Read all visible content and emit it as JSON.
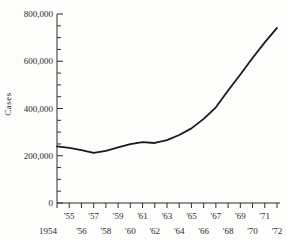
{
  "chart_data": {
    "type": "line",
    "title": "",
    "ylabel": "Cases",
    "xlabel": "",
    "x": [
      1954,
      1955,
      1956,
      1957,
      1958,
      1959,
      1960,
      1961,
      1962,
      1963,
      1964,
      1965,
      1966,
      1967,
      1968,
      1969,
      1970,
      1971,
      1972
    ],
    "values": [
      240000,
      233000,
      224000,
      212000,
      221000,
      235000,
      249000,
      258000,
      254000,
      266000,
      288000,
      316000,
      356000,
      405000,
      476000,
      544000,
      614000,
      680000,
      741000
    ],
    "xlim": [
      1954,
      1972
    ],
    "ylim": [
      0,
      800000
    ],
    "y_major_ticks": {
      "values": [
        0,
        200000,
        400000,
        600000,
        800000
      ],
      "labels": [
        "0",
        "200,000",
        "400,000",
        "600,000",
        "800,000"
      ]
    },
    "y_minor_step": 50000,
    "x_tick_step_years": 1,
    "x_labels_row1": [
      "'55",
      "'57",
      "'59",
      "'61",
      "'63",
      "'65",
      "'67",
      "'69",
      "'71"
    ],
    "x_labels_row2": [
      "1954",
      "'56",
      "'58",
      "'60",
      "'62",
      "'64",
      "'66",
      "'68",
      "'70",
      "'72"
    ],
    "grid": false,
    "legend": "none",
    "colors": {
      "line": "#1b1b1b",
      "axis": "#2e2e2e",
      "text": "#2b2b2b",
      "background": "#fdfdfb"
    }
  }
}
